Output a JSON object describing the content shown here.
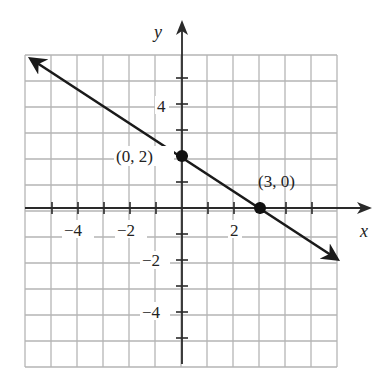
{
  "chart_data": {
    "type": "line",
    "title": "",
    "xlabel": "x",
    "ylabel": "y",
    "xlim": [
      -6,
      6
    ],
    "ylim": [
      -6,
      6
    ],
    "grid": true,
    "grid_step": 1,
    "x_tick_labels": [
      "-4",
      "-2",
      "2"
    ],
    "y_tick_labels": [
      "4",
      "-2",
      "-4"
    ],
    "series": [
      {
        "name": "line",
        "equation": "y = -2/3 x + 2",
        "x": [
          -6,
          6
        ],
        "y": [
          6,
          -2
        ],
        "arrows": "both"
      }
    ],
    "points": [
      {
        "x": 0,
        "y": 2,
        "label": "(0, 2)"
      },
      {
        "x": 3,
        "y": 0,
        "label": "(3, 0)"
      }
    ]
  },
  "labels": {
    "x_axis": "x",
    "y_axis": "y",
    "xt_neg4": "−4",
    "xt_neg2": "−2",
    "xt_2": "2",
    "yt_4": "4",
    "yt_neg2": "−2",
    "yt_neg4": "−4",
    "p1": "(0, 2)",
    "p2": "(3, 0)"
  },
  "colors": {
    "grid": "#b5b5b5",
    "axis": "#2a2a2a",
    "line": "#1a1a1a"
  }
}
